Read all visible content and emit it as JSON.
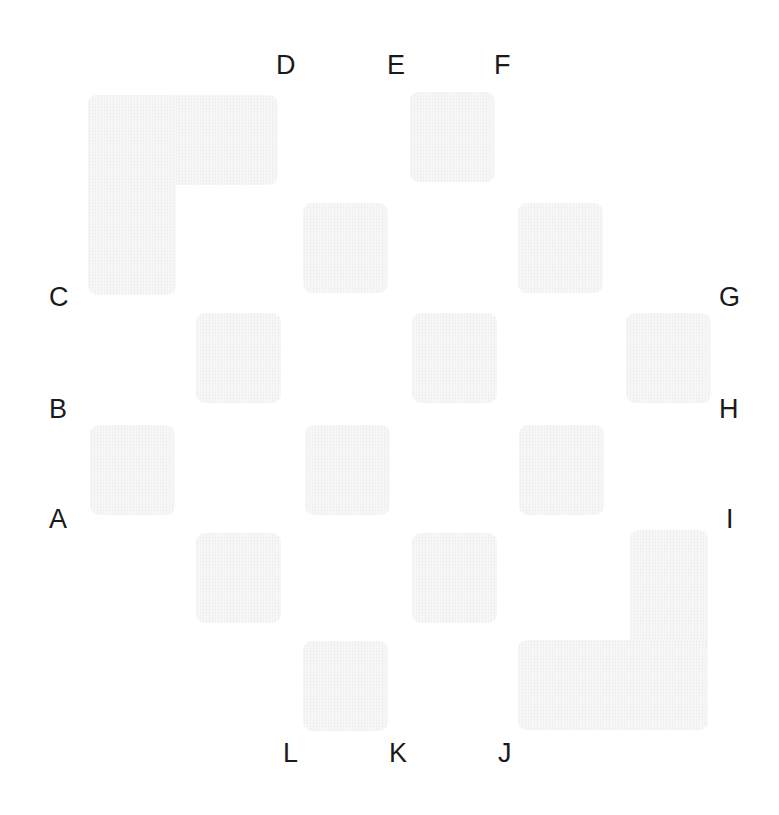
{
  "figure": {
    "kind": "tile-placement-puzzle",
    "background_color": "#ffffff",
    "tile_color": "#eeeeee",
    "label_color": "#1a1a1a",
    "width": 779,
    "height": 815
  },
  "labels": {
    "top": [
      {
        "id": "D",
        "text": "D",
        "x": 276,
        "y": 52
      },
      {
        "id": "E",
        "text": "E",
        "x": 387,
        "y": 52
      },
      {
        "id": "F",
        "text": "F",
        "x": 494,
        "y": 52
      }
    ],
    "left": [
      {
        "id": "C",
        "text": "C",
        "x": 49,
        "y": 284
      },
      {
        "id": "B",
        "text": "B",
        "x": 49,
        "y": 396
      },
      {
        "id": "A",
        "text": "A",
        "x": 49,
        "y": 506
      }
    ],
    "right": [
      {
        "id": "G",
        "text": "G",
        "x": 719,
        "y": 284
      },
      {
        "id": "H",
        "text": "H",
        "x": 719,
        "y": 396
      },
      {
        "id": "I",
        "text": "I",
        "x": 726,
        "y": 506
      }
    ],
    "bottom": [
      {
        "id": "L",
        "text": "L",
        "x": 283,
        "y": 740
      },
      {
        "id": "K",
        "text": "K",
        "x": 389,
        "y": 740
      },
      {
        "id": "J",
        "text": "J",
        "x": 498,
        "y": 740
      }
    ]
  },
  "tiles": [
    {
      "id": "tile-l-top-left",
      "shape": "L",
      "x": 88,
      "y": 95,
      "width": 190,
      "height": 200,
      "arm_h": {
        "x": 0,
        "y": 0,
        "width": 190,
        "height": 90
      },
      "arm_v": {
        "x": 0,
        "y": 0,
        "width": 88,
        "height": 200
      }
    },
    {
      "id": "tile-square-e-top",
      "shape": "square",
      "x": 410,
      "y": 92,
      "width": 85,
      "height": 90
    },
    {
      "id": "tile-square-d-mid",
      "shape": "square",
      "x": 303,
      "y": 203,
      "width": 85,
      "height": 90
    },
    {
      "id": "tile-square-f-mid",
      "shape": "square",
      "x": 518,
      "y": 203,
      "width": 85,
      "height": 90
    },
    {
      "id": "tile-square-c-row-left",
      "shape": "square",
      "x": 196,
      "y": 313,
      "width": 85,
      "height": 90
    },
    {
      "id": "tile-square-c-row-mid",
      "shape": "square",
      "x": 412,
      "y": 313,
      "width": 85,
      "height": 90
    },
    {
      "id": "tile-square-g-row-right",
      "shape": "square",
      "x": 626,
      "y": 313,
      "width": 85,
      "height": 90
    },
    {
      "id": "tile-square-b-row-left",
      "shape": "square",
      "x": 90,
      "y": 425,
      "width": 85,
      "height": 90
    },
    {
      "id": "tile-square-b-row-mid",
      "shape": "square",
      "x": 305,
      "y": 425,
      "width": 85,
      "height": 90
    },
    {
      "id": "tile-square-h-row-right",
      "shape": "square",
      "x": 519,
      "y": 425,
      "width": 85,
      "height": 90
    },
    {
      "id": "tile-square-a-row-left",
      "shape": "square",
      "x": 196,
      "y": 533,
      "width": 85,
      "height": 90
    },
    {
      "id": "tile-square-a-row-mid",
      "shape": "square",
      "x": 412,
      "y": 533,
      "width": 85,
      "height": 90
    },
    {
      "id": "tile-square-bottom-center",
      "shape": "square",
      "x": 303,
      "y": 641,
      "width": 85,
      "height": 90
    },
    {
      "id": "tile-l-bottom-right",
      "shape": "L-mirrored",
      "x": 518,
      "y": 530,
      "width": 190,
      "height": 200,
      "arm_v": {
        "x": 112,
        "y": 0,
        "width": 78,
        "height": 200
      },
      "arm_h": {
        "x": 0,
        "y": 110,
        "width": 190,
        "height": 90
      }
    }
  ]
}
